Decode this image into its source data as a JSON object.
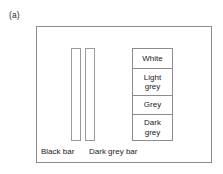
{
  "figure": {
    "panel_label": "(a)",
    "background_color": "#ffffff",
    "frame_color": "#8c8c8c"
  },
  "bars": [
    {
      "id": "black-bar",
      "caption": "Black bar",
      "fill": "#ffffff",
      "outline": "#9a9a9a"
    },
    {
      "id": "dark-grey-bar",
      "caption": "Dark grey bar",
      "fill": "#ffffff",
      "outline": "#9a9a9a"
    }
  ],
  "legend": {
    "rows": [
      {
        "label": "White"
      },
      {
        "label": "Light\ngrey"
      },
      {
        "label": "Grey"
      },
      {
        "label": "Dark\ngrey"
      }
    ]
  }
}
